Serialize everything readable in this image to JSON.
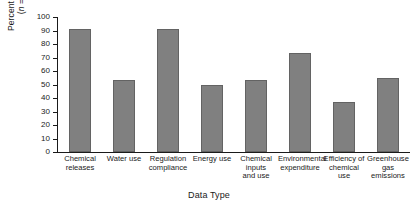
{
  "chart_data": {
    "type": "bar",
    "title": "",
    "xlabel": "Data Type",
    "ylabel": "Percent of Firms (n = 33)",
    "ylabel_line1": "Percent of Firms",
    "ylabel_line2_prefix": "(",
    "ylabel_line2_italic": "n",
    "ylabel_line2_suffix": " = 33)",
    "categories": [
      "Chemical releases",
      "Water use",
      "Regulation compliance",
      "Energy use",
      "Chemical inputs and use",
      "Environmental expenditure",
      "Efficiency of chemical use",
      "Greenhouse gas emissions"
    ],
    "category_lines": [
      [
        "Chemical",
        "releases"
      ],
      [
        "Water use"
      ],
      [
        "Regulation",
        "compliance"
      ],
      [
        "Energy use"
      ],
      [
        "Chemical",
        "inputs",
        "and use"
      ],
      [
        "Environmental",
        "expenditure"
      ],
      [
        "Efficiency of",
        "chemical",
        "use"
      ],
      [
        "Greenhouse",
        "gas",
        "emissions"
      ]
    ],
    "values": [
      91,
      53,
      91,
      50,
      53,
      73,
      37,
      55
    ],
    "ylim": [
      0,
      100
    ],
    "ytick_values": [
      0,
      10,
      20,
      30,
      40,
      50,
      60,
      70,
      80,
      90,
      100
    ],
    "ytick_labels": [
      "0",
      "10",
      "20",
      "30",
      "40",
      "50",
      "60",
      "70",
      "80",
      "90",
      "100"
    ],
    "grid": false,
    "legend": "none",
    "bar_color": "#808080",
    "bar_edge_color": "#636363",
    "axis_color": "#1a1a1a",
    "background_color": "#ffffff"
  }
}
